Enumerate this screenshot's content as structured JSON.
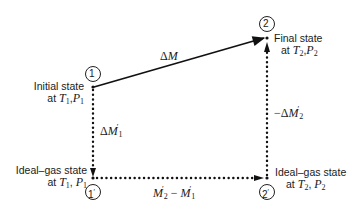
{
  "diagram": {
    "type": "thermodynamic-path",
    "nodes": [
      {
        "id": "1",
        "label": "1",
        "desc_line1": "Initial state",
        "desc_line2_prefix": "at",
        "var_a": "T",
        "sub_a": "1",
        "var_b": "P",
        "sub_b": "1"
      },
      {
        "id": "2",
        "label": "2",
        "desc_line1": "Final state",
        "desc_line2_prefix": "at",
        "var_a": "T",
        "sub_a": "2",
        "var_b": "P",
        "sub_b": "2"
      },
      {
        "id": "1p",
        "label": "1",
        "prime": "′",
        "desc_line1": "Ideal–gas state",
        "desc_line2_prefix": "at",
        "var_a": "T",
        "sub_a": "1",
        "var_b": "P",
        "sub_b": "1"
      },
      {
        "id": "2p",
        "label": "2",
        "prime": "′",
        "desc_line1": "Ideal–gas state",
        "desc_line2_prefix": "at",
        "var_a": "T",
        "sub_a": "2",
        "var_b": "P",
        "sub_b": "2"
      }
    ],
    "edges": [
      {
        "from": "1",
        "to": "2",
        "style": "solid",
        "label_prefix": "Δ",
        "label_var": "M"
      },
      {
        "from": "1",
        "to": "1p",
        "style": "dotted",
        "label_prefix": "Δ",
        "label_var": "M",
        "label_prime": "′",
        "label_sub": "1"
      },
      {
        "from": "1p",
        "to": "2p",
        "style": "dotted",
        "label_var_a": "M",
        "label_prime_a": "′",
        "label_sub_a": "2",
        "label_op": "−",
        "label_var_b": "M",
        "label_prime_b": "′",
        "label_sub_b": "1"
      },
      {
        "from": "2p",
        "to": "2",
        "style": "dotted",
        "label_prefix": "−Δ",
        "label_var": "M",
        "label_prime": "′",
        "label_sub": "2"
      }
    ],
    "comma": ","
  }
}
